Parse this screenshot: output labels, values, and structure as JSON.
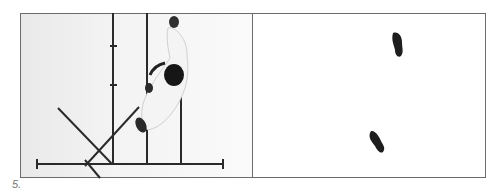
{
  "figure": {
    "label": "5.",
    "left_panel": {
      "description": "Top-down photo of a martial artist stepping over guide lines on the floor",
      "elements": [
        "figure-person",
        "vertical-guide-lines",
        "horizontal-baseline",
        "diagonal-lines"
      ]
    },
    "right_panel": {
      "description": "Footprint diagram showing two foot positions",
      "footprints": [
        "front-foot",
        "rear-foot"
      ]
    },
    "colors": {
      "line": "#2a2a2a",
      "frame": "#6b6b6b",
      "footprint": "#1e1e1e",
      "label": "#777777"
    }
  }
}
